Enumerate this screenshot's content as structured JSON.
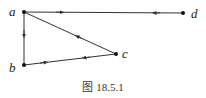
{
  "figure": {
    "caption": "图 18.5.1",
    "nodes": [
      {
        "id": "a",
        "label": "a",
        "x": 24,
        "y": 12
      },
      {
        "id": "b",
        "label": "b",
        "x": 24,
        "y": 65
      },
      {
        "id": "c",
        "label": "c",
        "x": 116,
        "y": 54
      },
      {
        "id": "d",
        "label": "d",
        "x": 183,
        "y": 13
      }
    ],
    "edges": [
      {
        "from": "a",
        "to": "d",
        "note": "arrow near a pointing toward d"
      },
      {
        "from": "d",
        "to": "a",
        "note": "arrow near d pointing toward a"
      },
      {
        "from": "a",
        "to": "b"
      },
      {
        "from": "c",
        "to": "a"
      },
      {
        "from": "b",
        "to": "c",
        "note": "arrow near b pointing toward c"
      },
      {
        "from": "c",
        "to": "b",
        "note": "arrow near c pointing toward b"
      }
    ],
    "colors": {
      "line": "#333333",
      "node": "#111111"
    }
  }
}
